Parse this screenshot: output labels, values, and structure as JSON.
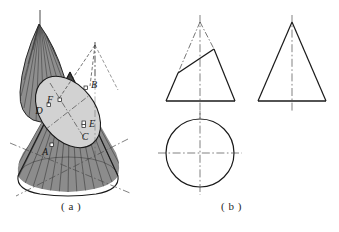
{
  "figure": {
    "captions": {
      "a": "( a )",
      "b": "( b )"
    },
    "colors": {
      "outline": "#1a1a1a",
      "cone_body_fill": "#8c8c8c",
      "cut_top_fill": "#7a7a7a",
      "section_ellipse_fill": "#cfcfcf",
      "hatch_line": "#3a3a3a",
      "center_line": "#4a4a4a",
      "background": "#ffffff"
    }
  },
  "pictorial": {
    "name": "oblique-cut-cone-pictorial",
    "vertex_labels": [
      {
        "id": "A",
        "text": "A",
        "x": 45,
        "y": 151,
        "marker_x": 53,
        "marker_y": 143
      },
      {
        "id": "B",
        "text": "B",
        "x": 92,
        "y": 85,
        "marker_x": 86,
        "marker_y": 88
      },
      {
        "id": "C",
        "text": "C",
        "x": 84,
        "y": 136,
        "marker_x": 85,
        "marker_y": 126
      },
      {
        "id": "D",
        "text": "D",
        "x": 39,
        "y": 111,
        "marker_x": 50,
        "marker_y": 106
      },
      {
        "id": "E",
        "text": "E",
        "x": 89,
        "y": 125,
        "marker_x": 84,
        "marker_y": 125
      },
      {
        "id": "F",
        "text": "F",
        "x": 49,
        "y": 101,
        "marker_x": 60,
        "marker_y": 101
      }
    ],
    "elements": [
      "removed-top-piece",
      "truncated-cone-body",
      "section-ellipse",
      "apex-construction-lines",
      "base-ellipse-center-lines"
    ]
  },
  "orthographic": {
    "name": "orthographic-projections",
    "views": [
      {
        "id": "front-view-cut",
        "label": "front view with oblique cut",
        "shape": "triangle",
        "apex": {
          "x": 200,
          "y": 22
        },
        "base_left": {
          "x": 166,
          "y": 101
        },
        "base_right": {
          "x": 235,
          "y": 101
        },
        "cut_line": {
          "from_x": 178,
          "from_y": 73,
          "to_x": 214,
          "to_y": 49
        },
        "center_line": {
          "x": 200,
          "top_y": 15,
          "bottom_y": 118
        }
      },
      {
        "id": "top-view-circle",
        "label": "top view circle",
        "shape": "circle",
        "center": {
          "x": 200,
          "y": 153
        },
        "radius": 34,
        "h_center_line": {
          "from_x": 158,
          "to_x": 242,
          "y": 153
        },
        "v_center_line": {
          "x": 200,
          "from_y": 111,
          "to_y": 195
        }
      },
      {
        "id": "front-view-plain",
        "label": "front view plain cone",
        "shape": "triangle",
        "apex": {
          "x": 292,
          "y": 22
        },
        "base_left": {
          "x": 258,
          "y": 101
        },
        "base_right": {
          "x": 326,
          "y": 101
        },
        "center_line": {
          "x": 292,
          "top_y": 15,
          "bottom_y": 112
        }
      }
    ]
  }
}
